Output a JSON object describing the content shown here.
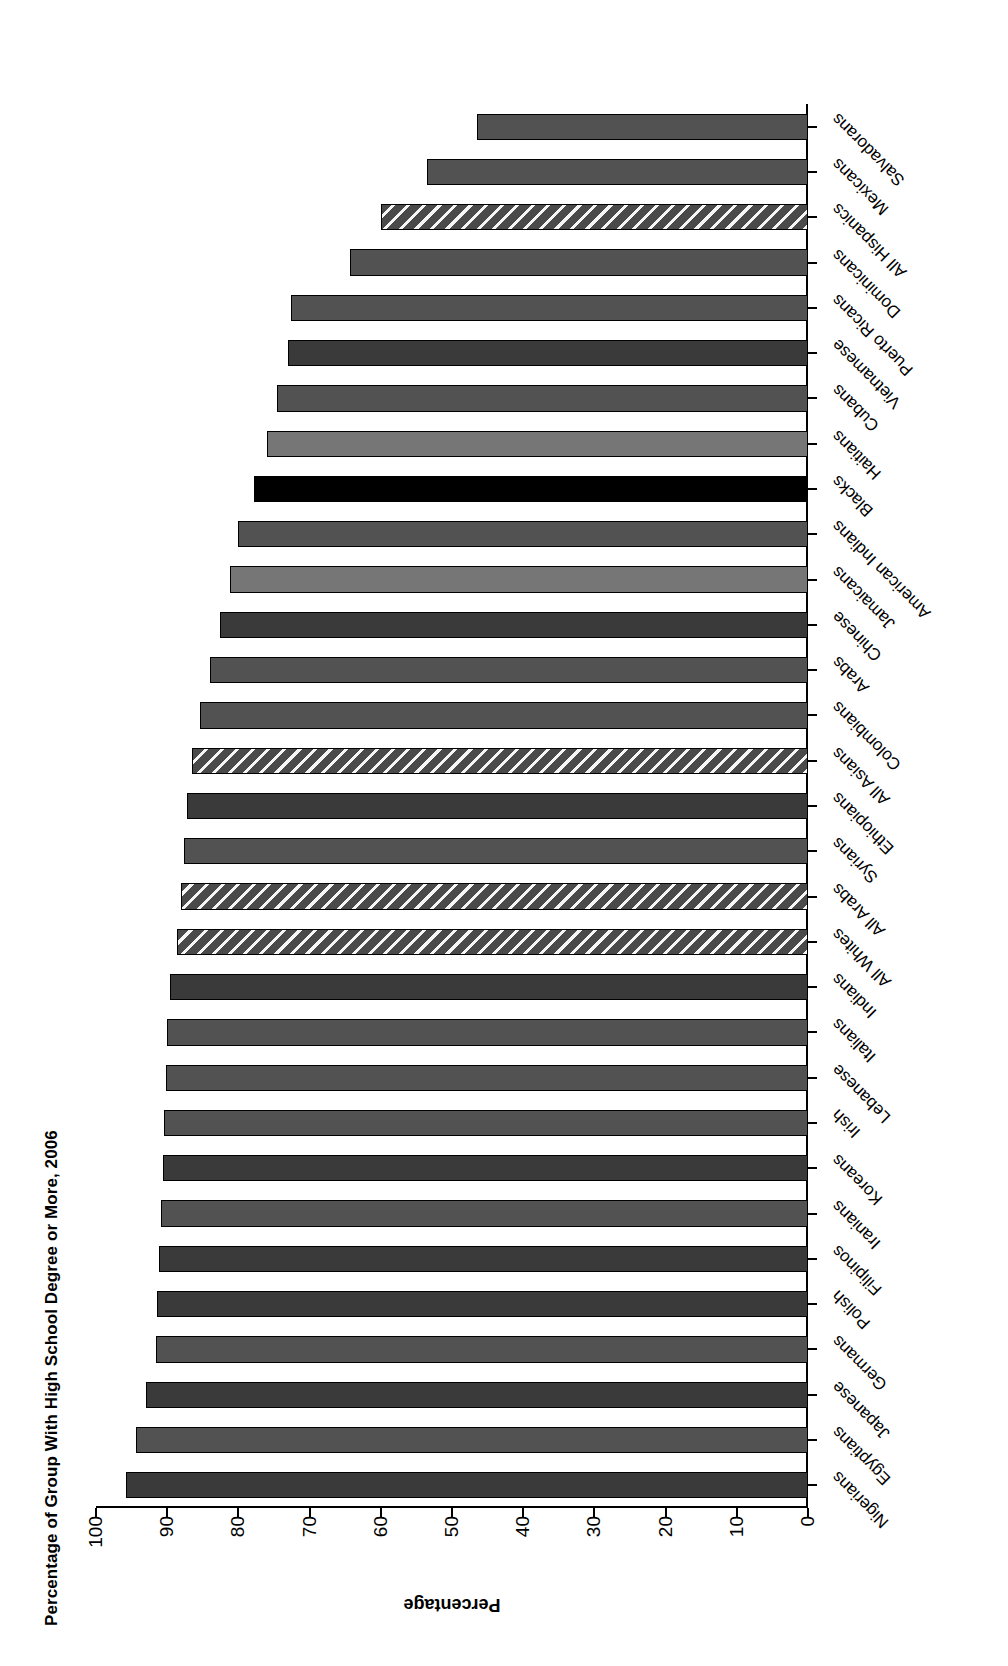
{
  "chart_data": {
    "type": "bar",
    "orientation": "vertical",
    "title": "Percentage of Group With High School Degree or More, 2006",
    "xlabel": "",
    "ylabel": "Percentage",
    "ylim": [
      0,
      100
    ],
    "ytick_labels": [
      "0",
      "10",
      "20",
      "30",
      "40",
      "50",
      "60",
      "70",
      "80",
      "90",
      "100"
    ],
    "ytick_values": [
      0,
      10,
      20,
      30,
      40,
      50,
      60,
      70,
      80,
      90,
      100
    ],
    "grid": false,
    "legend": "none",
    "categories": [
      "Nigerians",
      "Egyptians",
      "Japanese",
      "Germans",
      "Polish",
      "Filipinos",
      "Iranians",
      "Koreans",
      "Irish",
      "Lebanese",
      "Italians",
      "Indians",
      "All Whites",
      "All Arabs",
      "Syrians",
      "Ethiopians",
      "All Asians",
      "Colombians",
      "Arabs",
      "Chinese",
      "Jamaicans",
      "American Indians",
      "Blacks",
      "Haitians",
      "Cubans",
      "Vietnamese",
      "Puerto Ricans",
      "Dominicans",
      "All Hispanics",
      "Mexicans",
      "Salvadorans"
    ],
    "values": [
      95.8,
      94.4,
      93.0,
      91.6,
      91.4,
      91.2,
      90.9,
      90.6,
      90.4,
      90.2,
      90.0,
      89.6,
      88.6,
      88.0,
      87.6,
      87.2,
      86.5,
      85.4,
      84.0,
      82.6,
      81.2,
      80.0,
      77.8,
      76.0,
      74.6,
      73.1,
      72.6,
      64.3,
      60.0,
      53.5,
      46.5
    ],
    "bar_styles": [
      "solid-dark",
      "solid-mid",
      "solid-dark",
      "solid-mid",
      "solid-dark",
      "solid-dark",
      "solid-mid",
      "solid-dark",
      "solid-mid",
      "solid-mid",
      "solid-mid",
      "solid-dark",
      "hatched",
      "hatched",
      "solid-mid",
      "solid-dark",
      "hatched",
      "solid-mid",
      "solid-mid",
      "solid-dark",
      "solid-light",
      "solid-mid",
      "solid-black",
      "solid-light",
      "solid-mid",
      "solid-dark",
      "solid-mid",
      "solid-mid",
      "hatched",
      "solid-mid",
      "solid-mid"
    ]
  },
  "colors": {
    "solid-dark": "#3a3a3a",
    "solid-mid": "#525252",
    "solid-light": "#767676",
    "solid-black": "#000000",
    "hatched": "#4a4a4a",
    "axis": "#000000",
    "background": "#ffffff"
  }
}
